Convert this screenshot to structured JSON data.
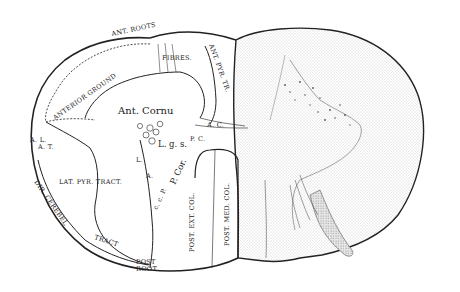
{
  "diagram": {
    "colors": {
      "ink": "#222222",
      "paper": "#ffffff",
      "stipple": "#bdbdbd",
      "stipple_dark": "#8a8a8a"
    },
    "labels": {
      "ant_roots": "ANT. ROOTS",
      "fibres": "FIBRES.",
      "ant_pyr_tr": "ANT. PYR. TR.",
      "anterior_ground": "ANTERIOR GROUND",
      "ant_cornu": "Ant. Cornu",
      "a_l_a_t": "A. L.",
      "a_t": "A. T.",
      "a_c": "A. C.",
      "p_c": "P. C.",
      "l_g_s": "L. g. s.",
      "l": "L.",
      "a": "A.",
      "p_cor": "P. Cor.",
      "c_c_p": "c. c. P.",
      "lat_pyr_tract": "LAT. PYR. TRACT.",
      "dir_cerebel": "DIR. CEREBEL",
      "tract": "TRACT",
      "post_root_1": "POST",
      "post_root_2": "ROOT",
      "post_ext_col": "POST. EXT. COL.",
      "post_med_col": "POST. MED. COL."
    }
  }
}
